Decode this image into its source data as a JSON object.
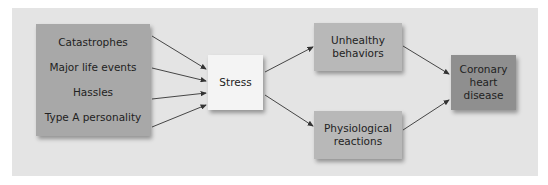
{
  "diagram": {
    "causes": [
      "Catastrophes",
      "Major life events",
      "Hassles",
      "Type A personality"
    ],
    "stress": "Stress",
    "mediators": {
      "unhealthy": [
        "Unhealthy",
        "behaviors"
      ],
      "physiological": [
        "Physiological",
        "reactions"
      ]
    },
    "outcome": [
      "Coronary",
      "heart",
      "disease"
    ],
    "colors": {
      "panel": "#e4e4e4",
      "causes_box": "#a8a8a8",
      "stress_box": "#f4f4f4",
      "mediator_box": "#b8b8b8",
      "outcome_box": "#8f8f8f",
      "arrow": "#333333"
    }
  }
}
